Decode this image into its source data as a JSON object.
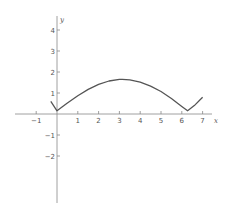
{
  "chart_data": {
    "type": "line",
    "title": "",
    "xlabel": "x",
    "ylabel": "y",
    "xlim": [
      -1.9,
      7.4
    ],
    "ylim": [
      -4.2,
      4.6
    ],
    "grid": false,
    "legend": null,
    "x_ticks": [
      -1,
      1,
      2,
      3,
      4,
      5,
      6,
      7
    ],
    "y_ticks": [
      4,
      3,
      2,
      1,
      -1,
      -2
    ],
    "x_tick_labels": [
      "−1",
      "1",
      "2",
      "3",
      "4",
      "5",
      "6",
      "7"
    ],
    "y_tick_labels": [
      "4",
      "3",
      "2",
      "1",
      "−1",
      "−2"
    ],
    "series": [
      {
        "name": "curve",
        "color": "#555555",
        "x": [
          -0.3,
          0.0,
          0.5,
          1.0,
          1.5,
          2.0,
          2.5,
          3.0,
          3.14,
          3.5,
          4.0,
          4.5,
          5.0,
          5.5,
          6.0,
          6.28,
          6.6,
          7.0
        ],
        "y": [
          0.6,
          0.15,
          0.52,
          0.87,
          1.17,
          1.41,
          1.57,
          1.65,
          1.65,
          1.63,
          1.52,
          1.33,
          1.07,
          0.74,
          0.36,
          0.15,
          0.4,
          0.8
        ]
      }
    ]
  },
  "axes": {
    "x_label": "x",
    "y_label": "y"
  }
}
